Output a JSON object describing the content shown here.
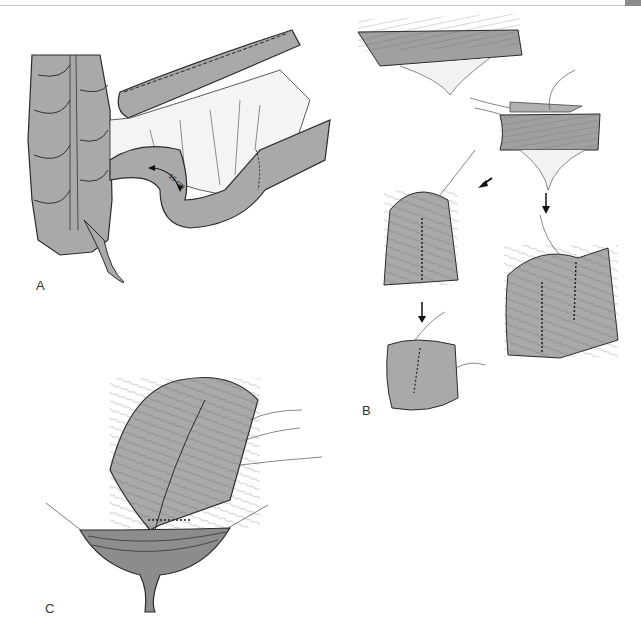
{
  "figure": {
    "panels": [
      {
        "id": "A",
        "label": "A",
        "annotation": "15 cm",
        "description": "Colon with mesentery, bowel loop with 15 cm segment marked by curved arrow"
      },
      {
        "id": "B",
        "label": "B",
        "description": "Sequence of bowel segment folding into pouch with sutured seams, arrows showing steps"
      },
      {
        "id": "C",
        "label": "C",
        "description": "Folded pouch anastomosed to opened pelvic stump with sutures"
      }
    ]
  },
  "colors": {
    "tissue": "#a9a9a9",
    "tissue_dark": "#8c8c8c",
    "outline": "#2a2a2a",
    "mesentery": "#f4f4f4",
    "rule": "#c8c8c8",
    "tab": "#8a8a8a"
  }
}
